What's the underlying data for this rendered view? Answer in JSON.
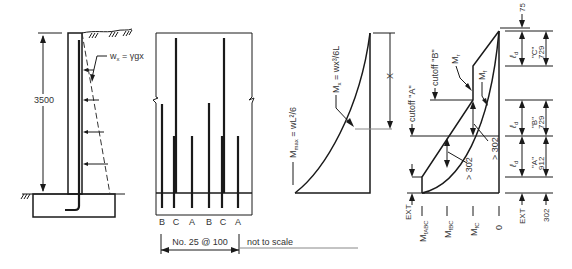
{
  "wall": {
    "height_label": "3500",
    "pressure_label": "w",
    "pressure_sub": "x",
    "pressure_eq": " = γgx"
  },
  "bars": {
    "labels": [
      "B",
      "C",
      "A",
      "B",
      "C",
      "A"
    ],
    "spacing_label": "No. 25 @ 100",
    "scale_note": "not to scale"
  },
  "moment": {
    "mmax_label": "M",
    "mmax_sub": "max",
    "mmax_eq": " = wL²/6",
    "mx_label": "M",
    "mx_sub": "x",
    "mx_eq": " = wx³/6L",
    "x_label": "X"
  },
  "resistance": {
    "cutoff_a": "cutoff \"A\"",
    "cutoff_b": "cutoff \"B\"",
    "mr_label": "M",
    "mr_sub": "r",
    "mf_label": "M",
    "mf_sub": "f",
    "gt302_a": "> 302",
    "gt302_b": "> 302",
    "ext_label": "EXT",
    "axis_labels": [
      {
        "main": "M",
        "sub": "fABC"
      },
      {
        "main": "M",
        "sub": "fBC"
      },
      {
        "main": "M",
        "sub": "fC"
      },
      {
        "main": "0",
        "sub": ""
      }
    ]
  },
  "dimensions": {
    "top": "75",
    "ld": "ℓ",
    "ld_sub": "d",
    "c_name": "\"C\"",
    "c_val": "729",
    "b_name": "\"B\"",
    "b_val": "729",
    "a_name": "\"A\"",
    "a_val": "912",
    "ext": "EXT",
    "ext_val": "302"
  }
}
